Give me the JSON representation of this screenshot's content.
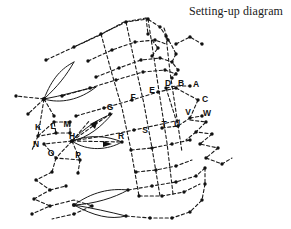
{
  "figure": {
    "title": "Setting-up diagram",
    "background_color": "#ffffff",
    "ink_color": "#1a1a1a",
    "style": "dotted-line technical pricking / setting-up diagram with labelled nodes"
  },
  "labels": {
    "A": "A",
    "B": "B",
    "C": "C",
    "D": "D",
    "E": "E",
    "F": "F",
    "G": "G",
    "H": "H",
    "K": "K",
    "L": "L",
    "M": "M",
    "N": "N",
    "O": "O",
    "P": "P",
    "R": "R",
    "S": "S",
    "T": "T",
    "U": "U",
    "V": "V",
    "W": "W"
  },
  "label_points": [
    {
      "id": "A",
      "x": 196,
      "y": 87
    },
    {
      "id": "B",
      "x": 181,
      "y": 86
    },
    {
      "id": "C",
      "x": 205,
      "y": 102
    },
    {
      "id": "D",
      "x": 168,
      "y": 86
    },
    {
      "id": "E",
      "x": 152,
      "y": 93
    },
    {
      "id": "F",
      "x": 133,
      "y": 100
    },
    {
      "id": "G",
      "x": 110,
      "y": 110
    },
    {
      "id": "H",
      "x": 72,
      "y": 142
    },
    {
      "id": "K",
      "x": 38,
      "y": 129
    },
    {
      "id": "L",
      "x": 53,
      "y": 128
    },
    {
      "id": "M",
      "x": 67,
      "y": 126
    },
    {
      "id": "N",
      "x": 38,
      "y": 145
    },
    {
      "id": "O",
      "x": 51,
      "y": 155
    },
    {
      "id": "P",
      "x": 78,
      "y": 157
    },
    {
      "id": "R",
      "x": 121,
      "y": 141
    },
    {
      "id": "S",
      "x": 145,
      "y": 135
    },
    {
      "id": "T",
      "x": 167,
      "y": 130
    },
    {
      "id": "U",
      "x": 179,
      "y": 130
    },
    {
      "id": "V",
      "x": 189,
      "y": 115
    },
    {
      "id": "W",
      "x": 206,
      "y": 116
    }
  ],
  "arrows": [
    {
      "name": "arrow-to-h",
      "direction": "left-down"
    },
    {
      "name": "arrow-from-h",
      "direction": "right"
    }
  ]
}
